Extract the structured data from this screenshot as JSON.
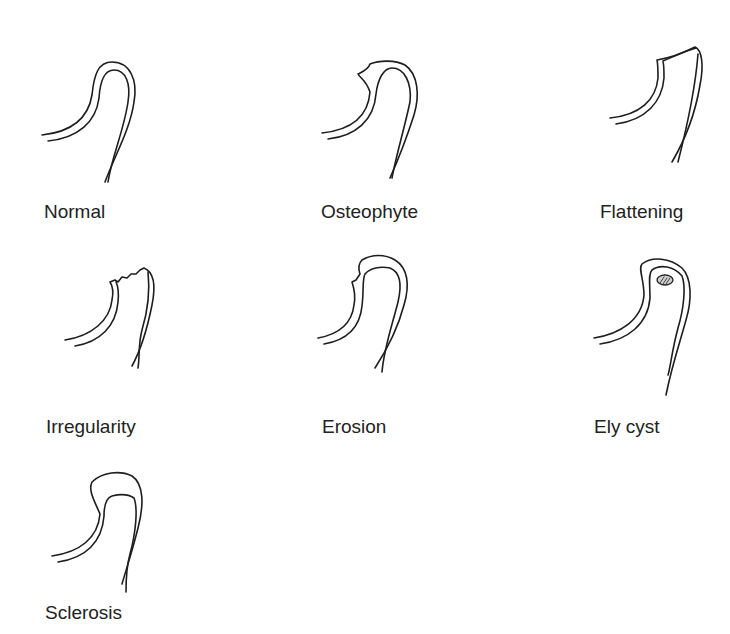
{
  "figure": {
    "panels": [
      {
        "id": "normal",
        "label": "Normal"
      },
      {
        "id": "osteophyte",
        "label": "Osteophyte"
      },
      {
        "id": "flattening",
        "label": "Flattening"
      },
      {
        "id": "irregularity",
        "label": "Irregularity"
      },
      {
        "id": "erosion",
        "label": "Erosion"
      },
      {
        "id": "ely-cyst",
        "label": "Ely cyst"
      },
      {
        "id": "sclerosis",
        "label": "Sclerosis"
      }
    ],
    "colors": {
      "stroke": "#1e1e1e",
      "text": "#222222",
      "background": "#ffffff"
    }
  }
}
